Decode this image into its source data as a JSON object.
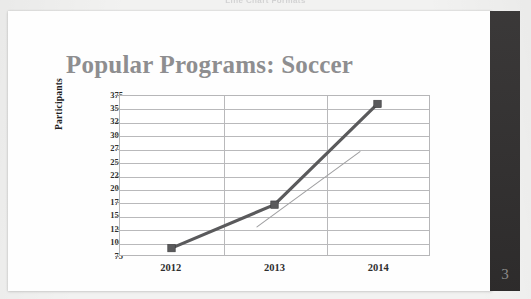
{
  "scan": {
    "running_header": "Line Chart Formats",
    "page_number": "3"
  },
  "slide": {
    "title": "Popular Programs: Soccer"
  },
  "chart_data": {
    "type": "line",
    "title": "Popular Programs: Soccer",
    "xlabel": "",
    "ylabel": "Participants",
    "categories": [
      "2012",
      "2013",
      "2014"
    ],
    "x_tick_labels": [
      "2012",
      "2013",
      "2014"
    ],
    "y_tick_labels": [
      "375",
      "350",
      "325",
      "300",
      "275",
      "250",
      "225",
      "200",
      "175",
      "150",
      "125",
      "100",
      "75"
    ],
    "y_ticks": [
      75,
      100,
      125,
      150,
      175,
      200,
      225,
      250,
      275,
      300,
      325,
      350,
      375
    ],
    "ylim": [
      75,
      375
    ],
    "y_step": 25,
    "grid": "horizontal-and-category-verticals",
    "legend": "none",
    "series": [
      {
        "name": "Soccer participants",
        "style": "thick-line-with-square-markers",
        "color": "#5a5a5c",
        "marker": "square",
        "values": [
          88,
          170,
          360
        ]
      },
      {
        "name": "Trendline",
        "style": "thin-line-no-markers",
        "color": "#a0a0a2",
        "marker": "none",
        "x": [
          2012.83,
          2013.83
        ],
        "values": [
          128,
          270
        ]
      }
    ]
  }
}
